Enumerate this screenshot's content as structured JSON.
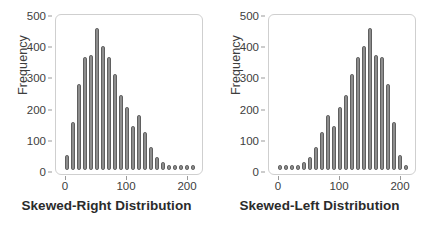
{
  "figure": {
    "background": "#ffffff",
    "bar_fill": "#8d8d8d",
    "bar_stroke": "#5f5f5f",
    "frame_stroke": "#cfcfcf",
    "text_color": "#3d3d3d"
  },
  "chart_data": [
    {
      "type": "bar",
      "id": "skewed-right",
      "title": "Skewed-Right Distribution",
      "xlabel": "Skewed-Right Distribution",
      "ylabel": "Frequency",
      "grid": false,
      "legend": null,
      "xlim": [
        -8,
        235
      ],
      "ylim": [
        0,
        540
      ],
      "xticks": [
        0,
        100,
        200
      ],
      "xticklabels": [
        "0",
        "100",
        "200"
      ],
      "yticks": [
        0,
        100,
        200,
        300,
        400,
        500
      ],
      "yticklabels": [
        "0",
        "100",
        "200",
        "300",
        "400",
        "500"
      ],
      "bin_width": 10,
      "x": [
        10,
        20,
        30,
        40,
        50,
        60,
        70,
        80,
        90,
        100,
        110,
        120,
        130,
        140,
        150,
        160,
        170,
        180,
        190,
        200,
        210,
        220
      ],
      "values": [
        55,
        170,
        305,
        400,
        410,
        505,
        440,
        400,
        340,
        265,
        225,
        155,
        195,
        135,
        80,
        45,
        30,
        10,
        8,
        8,
        8,
        8
      ]
    },
    {
      "type": "bar",
      "id": "skewed-left",
      "title": "Skewed-Left Distribution",
      "xlabel": "Skewed-Left Distribution",
      "ylabel": "Frequency",
      "grid": false,
      "legend": null,
      "xlim": [
        -8,
        235
      ],
      "ylim": [
        0,
        540
      ],
      "xticks": [
        0,
        100,
        200
      ],
      "xticklabels": [
        "0",
        "100",
        "200"
      ],
      "yticks": [
        0,
        100,
        200,
        300,
        400,
        500
      ],
      "yticklabels": [
        "0",
        "100",
        "200",
        "300",
        "400",
        "500"
      ],
      "bin_width": 10,
      "x": [
        10,
        20,
        30,
        40,
        50,
        60,
        70,
        80,
        90,
        100,
        110,
        120,
        130,
        140,
        150,
        160,
        170,
        180,
        190,
        200,
        210,
        220
      ],
      "values": [
        8,
        8,
        8,
        10,
        30,
        45,
        80,
        135,
        195,
        155,
        225,
        265,
        340,
        400,
        440,
        505,
        410,
        400,
        305,
        170,
        55,
        8
      ]
    }
  ],
  "panels": [
    {
      "axis_title": "Frequency",
      "caption": "Skewed-Right Distribution",
      "yticklabels": [
        "500",
        "400",
        "300",
        "200",
        "100",
        "0"
      ],
      "xticklabels": [
        "0",
        "100",
        "200"
      ]
    },
    {
      "axis_title": "Frequency",
      "caption": "Skewed-Left Distribution",
      "yticklabels": [
        "500",
        "400",
        "300",
        "200",
        "100",
        "0"
      ],
      "xticklabels": [
        "0",
        "100",
        "200"
      ]
    }
  ]
}
